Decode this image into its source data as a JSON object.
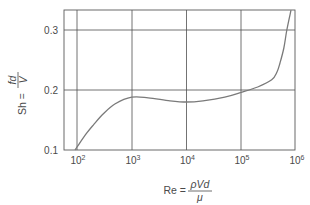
{
  "chart_data": {
    "type": "line",
    "title": "",
    "xscale": "log",
    "xlabel": "Re = ρVd/μ",
    "ylabel": "Sh = fd/V",
    "xlim": [
      57,
      1000000
    ],
    "ylim": [
      0.1,
      0.333
    ],
    "grid": true,
    "legend": null,
    "x_ticks": [
      100,
      1000,
      10000,
      100000,
      1000000
    ],
    "y_ticks": [
      0.1,
      0.2,
      0.3
    ],
    "series": [
      {
        "name": "Strouhal number vs Reynolds number",
        "color": "#7a7a7a",
        "x": [
          92,
          100,
          150,
          200,
          300,
          500,
          1000,
          2000,
          5000,
          10000,
          20000,
          50000,
          100000,
          200000,
          360000,
          450000,
          510000,
          600000,
          680000,
          810000
        ],
        "y": [
          0.1,
          0.105,
          0.128,
          0.142,
          0.16,
          0.177,
          0.188,
          0.187,
          0.182,
          0.18,
          0.182,
          0.188,
          0.196,
          0.205,
          0.217,
          0.23,
          0.245,
          0.27,
          0.3,
          0.333
        ]
      }
    ]
  },
  "axes": {
    "y_tick_labels": [
      "0.1",
      "0.2",
      "0.3"
    ],
    "x_tick_base": "10",
    "x_tick_exponents": [
      "2",
      "3",
      "4",
      "5",
      "6"
    ],
    "ylabel": {
      "lhs": "Sh =",
      "numerator": "fd",
      "denominator": "V"
    },
    "xlabel": {
      "lhs": "Re =",
      "numerator": "ρVd",
      "denominator": "μ"
    }
  },
  "colors": {
    "frame": "#5a5a5a",
    "grid": "#4f4f4f",
    "curve": "#7a7a7a",
    "text": "#4a4a4a"
  }
}
